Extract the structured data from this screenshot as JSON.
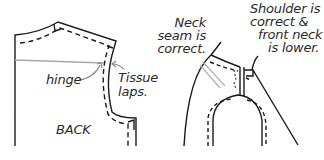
{
  "diagram": {
    "left_panel": {
      "piece_label": "BACK",
      "hinge_label": "hinge",
      "tissue_label_line1": "Tissue",
      "tissue_label_line2": "laps."
    },
    "right_panel": {
      "neck_label_line1": "Neck",
      "neck_label_line2": "seam is",
      "neck_label_line3": "correct.",
      "shoulder_label_line1": "Shoulder is",
      "shoulder_label_line2": "correct &",
      "shoulder_label_line3": "front neck",
      "shoulder_label_line4": "is lower."
    },
    "colors": {
      "line": "#1a1a1a",
      "hinge_line": "#b0b0b0",
      "background": "#ffffff"
    }
  }
}
